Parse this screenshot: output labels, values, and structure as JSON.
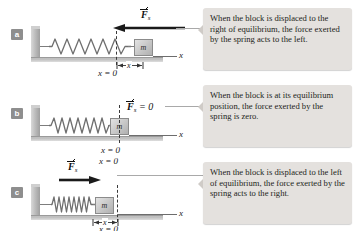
{
  "figure": {
    "background_color": "#ffffff",
    "caption_bg_color": "#e4e1de",
    "block_label": "m",
    "axis_label": "x",
    "equilibrium_label": "x = 0",
    "displacement_label": "x"
  },
  "panels": [
    {
      "id": "a",
      "badge": "a",
      "force_symbol": "F",
      "force_subscript": "s",
      "force_suffix": "",
      "force_direction": "left",
      "spring_state": "stretched",
      "block_position": "right of equilibrium",
      "axis_label": "x",
      "equilibrium_label": "x = 0",
      "displacement_label": "x",
      "caption": "When the block is displaced to the right of equilibrium, the force exerted by the spring acts to the left."
    },
    {
      "id": "b",
      "badge": "b",
      "force_symbol": "F",
      "force_subscript": "s",
      "force_suffix": " = 0",
      "force_direction": "none",
      "spring_state": "relaxed",
      "block_position": "at equilibrium",
      "axis_label": "x",
      "equilibrium_label": "x = 0",
      "displacement_label": "",
      "caption": "When the block is at its equilibrium position, the force exerted by the spring is zero."
    },
    {
      "id": "c",
      "badge": "c",
      "force_symbol": "F",
      "force_subscript": "s",
      "force_suffix": "",
      "force_direction": "right",
      "spring_state": "compressed",
      "block_position": "left of equilibrium",
      "axis_label": "x",
      "equilibrium_label": "x = 0",
      "displacement_label": "x",
      "caption": "When the block is displaced to the left of equilibrium, the force exerted by the spring acts to the right."
    }
  ]
}
